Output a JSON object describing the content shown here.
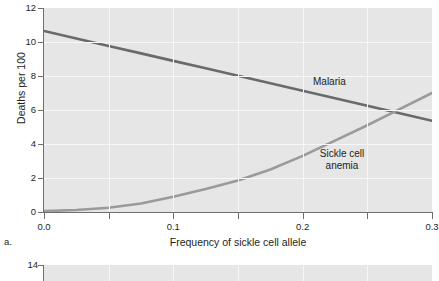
{
  "figure": {
    "panel_a_tag": "a."
  },
  "chart_data": {
    "type": "line",
    "title": "",
    "xlabel": "Frequency of sickle cell allele",
    "ylabel": "Deaths per 100",
    "xlim": [
      0.0,
      0.3
    ],
    "ylim": [
      0,
      12
    ],
    "grid": true,
    "legend_position": "inline-annotation",
    "xticks": [
      0.0,
      0.05,
      0.1,
      0.15,
      0.2,
      0.25,
      0.3
    ],
    "xtick_labels": [
      "0.0",
      "",
      "0.1",
      "",
      "0.2",
      "",
      "0.3"
    ],
    "yticks": [
      0,
      2,
      4,
      6,
      8,
      10,
      12
    ],
    "ytick_labels": [
      "0",
      "2",
      "4",
      "6",
      "8",
      "10",
      "12"
    ],
    "x": [
      0.0,
      0.025,
      0.05,
      0.075,
      0.1,
      0.125,
      0.15,
      0.175,
      0.2,
      0.225,
      0.25,
      0.275,
      0.3
    ],
    "series": [
      {
        "name": "Malaria",
        "color": "#6a6a6a",
        "values": [
          10.65,
          10.21,
          9.77,
          9.33,
          8.89,
          8.45,
          8.01,
          7.57,
          7.13,
          6.69,
          6.25,
          5.81,
          5.37
        ],
        "label_text": "Malaria"
      },
      {
        "name": "Sickle cell anemia",
        "color": "#9a9a9a",
        "values": [
          0.05,
          0.12,
          0.25,
          0.5,
          0.9,
          1.35,
          1.85,
          2.5,
          3.3,
          4.2,
          5.1,
          6.05,
          7.0
        ],
        "label_text": "Sickle cell\nanemia"
      }
    ],
    "annotations": [
      {
        "text": "Malaria",
        "x": 0.22,
        "y": 8.0
      },
      {
        "text": "Sickle cell anemia",
        "x": 0.215,
        "y": 3.6
      }
    ]
  },
  "panel_b": {
    "ytick_label_top": "14"
  }
}
